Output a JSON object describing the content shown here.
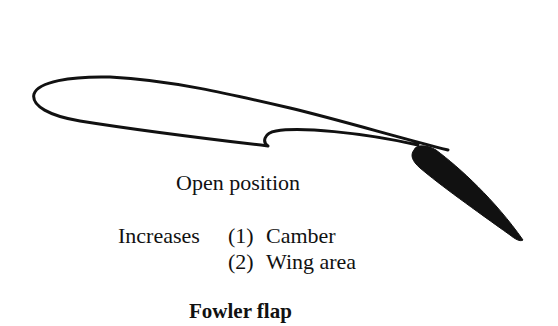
{
  "diagram": {
    "title": "Fowler flap",
    "state_caption": "Open position",
    "effects": {
      "label": "Increases",
      "items": [
        {
          "number": "(1)",
          "text": "Camber"
        },
        {
          "number": "(2)",
          "text": "Wing area"
        }
      ]
    },
    "colors": {
      "stroke": "#111111",
      "flap_fill": "#111111",
      "background": "#ffffff"
    },
    "parts": [
      "main-wing",
      "fowler-flap"
    ]
  }
}
